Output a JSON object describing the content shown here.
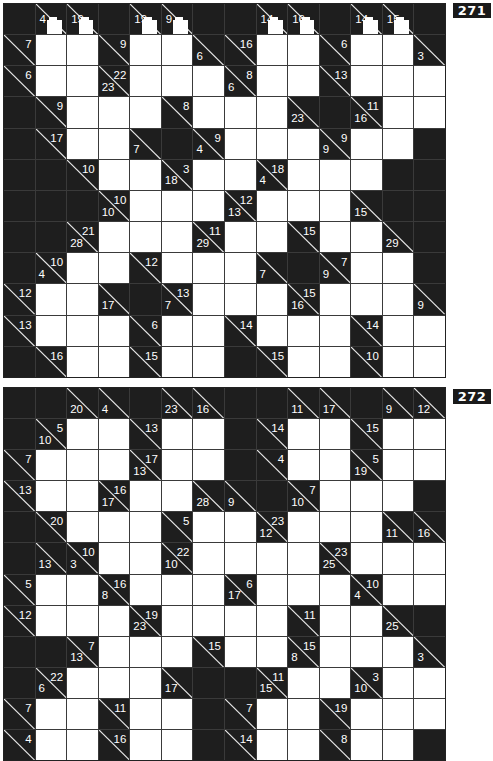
{
  "legend": {
    "B": "black cell",
    "W": "white entry cell",
    "clue": "{d: down sum, a: across sum, blob: white artifact overlay}"
  },
  "puzzles": [
    {
      "number": "271",
      "rows": 12,
      "cols": 14,
      "cells": [
        [
          "B",
          {
            "d": "4",
            "blob": true
          },
          {
            "d": "19",
            "blob": true
          },
          "B",
          {
            "d": "19",
            "blob": true
          },
          {
            "d": "9",
            "blob": true
          },
          "B",
          "B",
          {
            "d": "14",
            "blob": true
          },
          {
            "d": "16",
            "blob": true
          },
          "B",
          {
            "d": "14",
            "blob": true
          },
          {
            "d": "15",
            "blob": true
          },
          "B"
        ],
        [
          {
            "a": "7"
          },
          "W",
          "W",
          {
            "a": "9"
          },
          "W",
          "W",
          {
            "d": "6"
          },
          {
            "a": "16"
          },
          "W",
          "W",
          {
            "a": "6"
          },
          "W",
          "W",
          {
            "d": "3"
          }
        ],
        [
          {
            "a": "6"
          },
          "W",
          "W",
          {
            "d": "23",
            "a": "22"
          },
          "W",
          "W",
          "W",
          {
            "d": "6",
            "a": "8"
          },
          "W",
          "W",
          {
            "a": "13"
          },
          "W",
          "W",
          "W"
        ],
        [
          "B",
          {
            "a": "9"
          },
          "W",
          "W",
          "W",
          {
            "a": "8"
          },
          "W",
          "W",
          "W",
          {
            "d": "23"
          },
          "B",
          {
            "d": "16",
            "a": "11"
          },
          "W",
          "W"
        ],
        [
          "B",
          {
            "a": "17"
          },
          "W",
          "W",
          {
            "d": "7"
          },
          "B",
          {
            "d": "4",
            "a": "9"
          },
          "W",
          "W",
          "W",
          {
            "d": "9",
            "a": "9"
          },
          "W",
          "W",
          "B"
        ],
        [
          "B",
          "B",
          {
            "a": "10"
          },
          "W",
          "W",
          {
            "d": "18",
            "a": "3"
          },
          "W",
          "W",
          {
            "d": "4",
            "a": "18"
          },
          "W",
          "W",
          "W",
          "B",
          "B"
        ],
        [
          "B",
          "B",
          "B",
          {
            "d": "10",
            "a": "10"
          },
          "W",
          "W",
          "W",
          {
            "d": "13",
            "a": "12"
          },
          "W",
          "W",
          "W",
          {
            "d": "15"
          },
          "B",
          "B"
        ],
        [
          "B",
          "B",
          {
            "d": "28",
            "a": "21"
          },
          "W",
          "W",
          "W",
          {
            "d": "29",
            "a": "11"
          },
          "W",
          "W",
          {
            "a": "15"
          },
          "W",
          "W",
          {
            "d": "29"
          },
          "B"
        ],
        [
          "B",
          {
            "d": "4",
            "a": "10"
          },
          "W",
          "W",
          {
            "a": "12"
          },
          "W",
          "W",
          "W",
          {
            "d": "7"
          },
          "B",
          {
            "d": "9",
            "a": "7"
          },
          "W",
          "W",
          "B"
        ],
        [
          {
            "a": "12"
          },
          "W",
          "W",
          {
            "d": "17"
          },
          "B",
          {
            "d": "7",
            "a": "13"
          },
          "W",
          "W",
          "W",
          {
            "d": "16",
            "a": "15"
          },
          "W",
          "W",
          "W",
          {
            "d": "9"
          }
        ],
        [
          {
            "a": "13"
          },
          "W",
          "W",
          "W",
          {
            "a": "6"
          },
          "W",
          "W",
          {
            "a": "14"
          },
          "W",
          "W",
          "W",
          {
            "a": "14"
          },
          "W",
          "W"
        ],
        [
          "B",
          {
            "a": "16"
          },
          "W",
          "W",
          {
            "a": "15"
          },
          "W",
          "W",
          "B",
          {
            "a": "15"
          },
          "W",
          "W",
          {
            "a": "10"
          },
          "W",
          "W"
        ]
      ]
    },
    {
      "number": "272",
      "rows": 12,
      "cols": 14,
      "cells": [
        [
          "B",
          "B",
          {
            "d": "20"
          },
          {
            "d": "4"
          },
          "B",
          {
            "d": "23"
          },
          {
            "d": "16"
          },
          "B",
          "B",
          {
            "d": "11"
          },
          {
            "d": "17"
          },
          "B",
          {
            "d": "9"
          },
          {
            "d": "12"
          }
        ],
        [
          "B",
          {
            "d": "10",
            "a": "5"
          },
          "W",
          "W",
          {
            "a": "13"
          },
          "W",
          "W",
          "B",
          {
            "a": "14"
          },
          "W",
          "W",
          {
            "a": "15"
          },
          "W",
          "W"
        ],
        [
          {
            "a": "7"
          },
          "W",
          "W",
          "W",
          {
            "d": "13",
            "a": "17"
          },
          "W",
          "W",
          "B",
          {
            "a": "4"
          },
          "W",
          "W",
          {
            "d": "19",
            "a": "5"
          },
          "W",
          "W"
        ],
        [
          {
            "a": "13"
          },
          "W",
          "W",
          {
            "d": "17",
            "a": "16"
          },
          "W",
          "W",
          {
            "d": "28"
          },
          {
            "d": "9"
          },
          "B",
          {
            "d": "10",
            "a": "7"
          },
          "W",
          "W",
          "W",
          "B"
        ],
        [
          "B",
          {
            "a": "20"
          },
          "W",
          "W",
          "W",
          {
            "a": "5"
          },
          "W",
          "W",
          {
            "d": "12",
            "a": "23"
          },
          "W",
          "W",
          "W",
          {
            "d": "11"
          },
          {
            "d": "16"
          }
        ],
        [
          "B",
          {
            "d": "13"
          },
          {
            "d": "3",
            "a": "10"
          },
          "W",
          "W",
          {
            "d": "10",
            "a": "22"
          },
          "W",
          "W",
          "W",
          "W",
          {
            "d": "25",
            "a": "23"
          },
          "W",
          "W",
          "W"
        ],
        [
          {
            "a": "5"
          },
          "W",
          "W",
          {
            "d": "8",
            "a": "16"
          },
          "W",
          "W",
          "W",
          {
            "d": "17",
            "a": "6"
          },
          "W",
          "W",
          "W",
          {
            "d": "4",
            "a": "10"
          },
          "W",
          "W"
        ],
        [
          {
            "a": "12"
          },
          "W",
          "W",
          "W",
          {
            "d": "23",
            "a": "19"
          },
          "W",
          "W",
          "W",
          "W",
          {
            "a": "11"
          },
          "W",
          "W",
          {
            "d": "25"
          },
          "B"
        ],
        [
          "B",
          "B",
          {
            "d": "13",
            "a": "7"
          },
          "W",
          "W",
          "W",
          {
            "a": "15"
          },
          "W",
          "W",
          {
            "d": "8",
            "a": "15"
          },
          "W",
          "W",
          "W",
          {
            "d": "3"
          }
        ],
        [
          "B",
          {
            "d": "6",
            "a": "22"
          },
          "W",
          "W",
          "W",
          {
            "d": "17"
          },
          "B",
          "B",
          {
            "d": "15",
            "a": "11"
          },
          "W",
          "W",
          {
            "d": "10",
            "a": "3"
          },
          "W",
          "W"
        ],
        [
          {
            "a": "7"
          },
          "W",
          "W",
          {
            "a": "11"
          },
          "W",
          "W",
          "B",
          {
            "a": "7"
          },
          "W",
          "W",
          {
            "a": "19"
          },
          "W",
          "W",
          "W"
        ],
        [
          {
            "a": "4"
          },
          "W",
          "W",
          {
            "a": "16"
          },
          "W",
          "W",
          "B",
          {
            "a": "14"
          },
          "W",
          "W",
          {
            "a": "8"
          },
          "W",
          "W",
          "B"
        ]
      ]
    }
  ],
  "layout": {
    "puzzle_tops": [
      3,
      387
    ],
    "puzzle_heights": [
      375,
      374
    ],
    "label_tops": [
      3,
      389
    ]
  }
}
